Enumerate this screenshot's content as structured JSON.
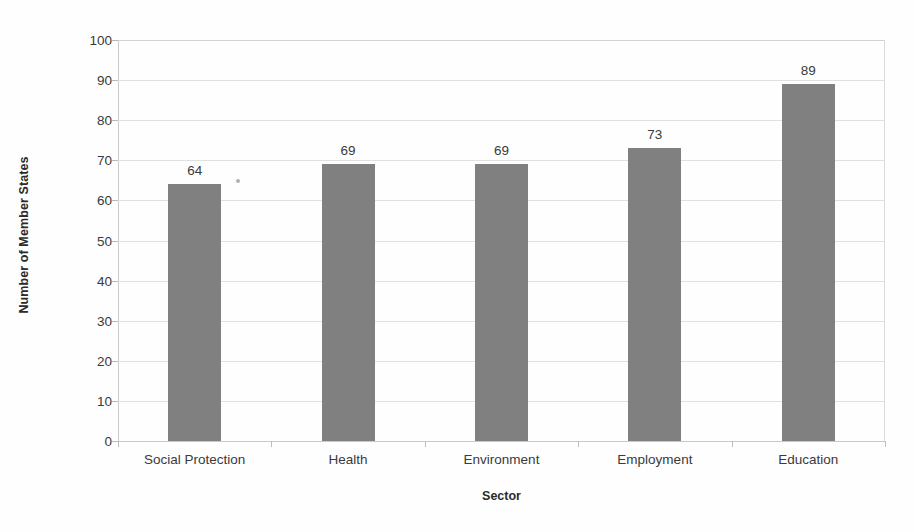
{
  "chart_data": {
    "type": "bar",
    "title": "",
    "subtitle": "",
    "xlabel": "Sector",
    "ylabel": "Number of Member States",
    "categories": [
      "Social Protection",
      "Health",
      "Environment",
      "Employment",
      "Education"
    ],
    "values": [
      64,
      69,
      69,
      73,
      89
    ],
    "data_labels": [
      "64",
      "69",
      "69",
      "73",
      "89"
    ],
    "ylim": [
      0,
      100
    ],
    "y_ticks": [
      0,
      10,
      20,
      30,
      40,
      50,
      60,
      70,
      80,
      90,
      100
    ],
    "y_tick_labels": [
      "0",
      "10",
      "20",
      "30",
      "40",
      "50",
      "60",
      "70",
      "80",
      "90",
      "100"
    ],
    "grid": true,
    "grid_axis": "y",
    "legend": false,
    "legend_position": "none",
    "bar_color": "#808080",
    "gridline_color": "#e0e0e0",
    "text_color": "#3a3a3a",
    "background_color": "#fefefe"
  },
  "artifacts": {
    "speck_label": "scan-artifact-speck"
  }
}
